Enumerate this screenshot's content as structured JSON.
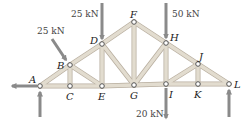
{
  "diagram": {
    "type": "roof-truss",
    "colors": {
      "member": "#d9d2c6",
      "member_edge": "#b8ae9f",
      "arrow": "#8a8a8a",
      "node_fill": "#ffffff",
      "node_stroke": "#555555",
      "text": "#222222"
    },
    "nodes": [
      {
        "id": "A",
        "x": 40,
        "y": 86,
        "label": "A"
      },
      {
        "id": "B",
        "x": 70,
        "y": 65,
        "label": "B"
      },
      {
        "id": "C",
        "x": 70,
        "y": 86,
        "label": "C"
      },
      {
        "id": "D",
        "x": 102,
        "y": 44,
        "label": "D"
      },
      {
        "id": "E",
        "x": 102,
        "y": 86,
        "label": "E"
      },
      {
        "id": "F",
        "x": 134,
        "y": 22,
        "label": "F"
      },
      {
        "id": "G",
        "x": 134,
        "y": 85,
        "label": "G"
      },
      {
        "id": "H",
        "x": 166,
        "y": 43,
        "label": "H"
      },
      {
        "id": "I",
        "x": 166,
        "y": 84,
        "label": "I"
      },
      {
        "id": "J",
        "x": 198,
        "y": 64,
        "label": "J"
      },
      {
        "id": "K",
        "x": 198,
        "y": 84,
        "label": "K"
      },
      {
        "id": "L",
        "x": 229,
        "y": 84,
        "label": "L"
      }
    ],
    "members": [
      [
        "A",
        "B"
      ],
      [
        "B",
        "D"
      ],
      [
        "D",
        "F"
      ],
      [
        "F",
        "H"
      ],
      [
        "H",
        "J"
      ],
      [
        "J",
        "L"
      ],
      [
        "A",
        "C"
      ],
      [
        "C",
        "E"
      ],
      [
        "E",
        "G"
      ],
      [
        "G",
        "I"
      ],
      [
        "I",
        "K"
      ],
      [
        "K",
        "L"
      ],
      [
        "B",
        "C"
      ],
      [
        "B",
        "E"
      ],
      [
        "D",
        "E"
      ],
      [
        "D",
        "G"
      ],
      [
        "F",
        "G"
      ],
      [
        "G",
        "H"
      ],
      [
        "H",
        "I"
      ],
      [
        "I",
        "J"
      ],
      [
        "J",
        "K"
      ]
    ],
    "loads": [
      {
        "at": "B",
        "label": "25 kN",
        "direction": "diagonal-down-right"
      },
      {
        "at": "D",
        "label": "25 kN",
        "direction": "down"
      },
      {
        "at": "H",
        "label": "50 kN",
        "direction": "down"
      },
      {
        "at": "I",
        "label": "20 kN",
        "direction": "down"
      }
    ],
    "reactions": [
      {
        "at": "A",
        "direction": "left"
      },
      {
        "at": "A",
        "direction": "up"
      },
      {
        "at": "L",
        "direction": "up"
      }
    ]
  }
}
